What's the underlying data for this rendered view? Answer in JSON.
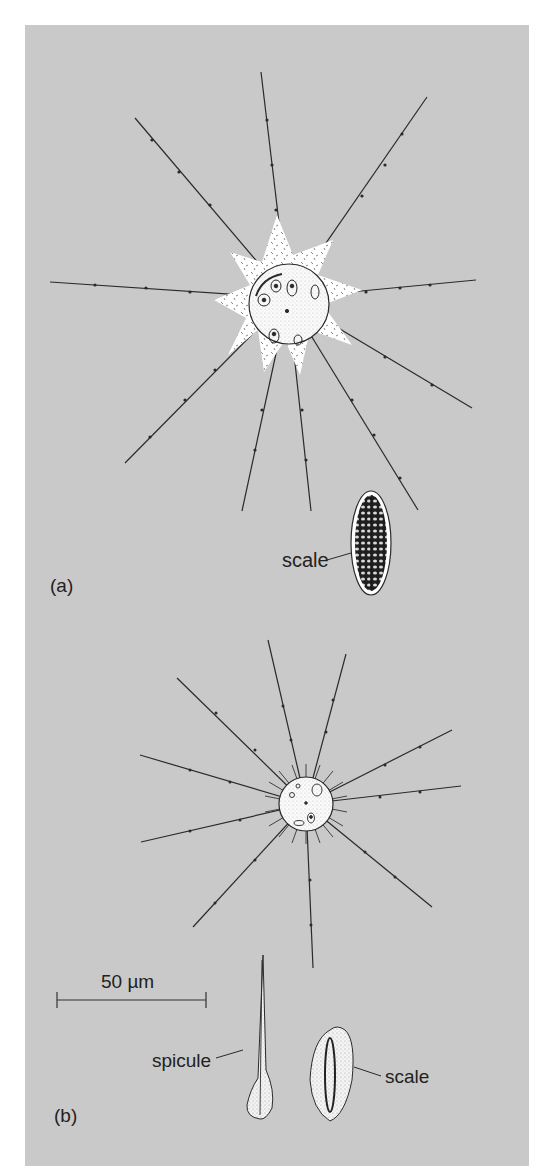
{
  "figure": {
    "panel_color": "#c9c9c9",
    "ink_color": "#2a2a2a",
    "cell_fill": "#ffffff"
  },
  "panel_a": {
    "label": "(a)",
    "scale_label": "scale"
  },
  "panel_b": {
    "label": "(b)",
    "spicule_label": "spicule",
    "scale_label": "scale"
  },
  "scale_bar": {
    "label": "50 µm"
  }
}
